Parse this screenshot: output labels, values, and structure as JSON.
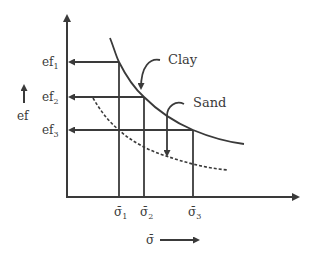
{
  "diagram": {
    "type": "e-log-p style curve comparison",
    "y_axis": {
      "label": "ef",
      "ticks": [
        {
          "label": "ef",
          "sub": "1",
          "y": 62
        },
        {
          "label": "ef",
          "sub": "2",
          "y": 97
        },
        {
          "label": "ef",
          "sub": "3",
          "y": 130
        }
      ]
    },
    "x_axis": {
      "label": "σ̄",
      "ticks": [
        {
          "label": "σ̄",
          "sub": "1",
          "x": 119
        },
        {
          "label": "σ̄",
          "sub": "2",
          "x": 144
        },
        {
          "label": "σ̄",
          "sub": "3",
          "x": 193
        }
      ]
    },
    "curves": [
      {
        "name": "Clay",
        "style": "solid"
      },
      {
        "name": "Sand",
        "style": "dashed"
      }
    ],
    "labels": {
      "clay": "Clay",
      "sand": "Sand"
    },
    "colors": {
      "line": "#3a3a3a",
      "background": "#ffffff"
    }
  }
}
